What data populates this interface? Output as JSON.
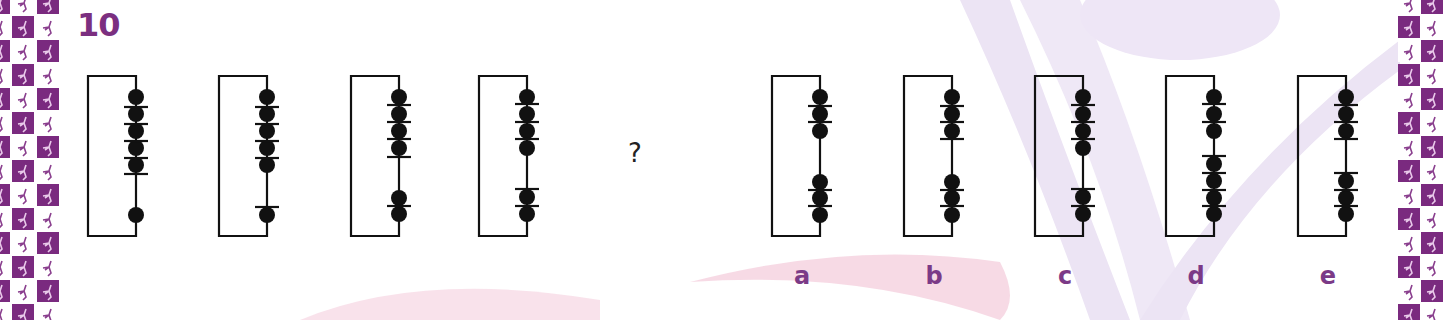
{
  "question": {
    "number": "10",
    "placeholder": "?"
  },
  "colors": {
    "accent_purple": "#7b2f80",
    "label_purple": "#7b3a87",
    "border_purple": "#7a2a7f",
    "bg_pink": "#f6d3e0",
    "bg_lavender": "#ece4f4",
    "ink": "#111111"
  },
  "sequence": [
    {
      "id": "fig-1",
      "x": 88,
      "beads": [
        97,
        114,
        131,
        148,
        165,
        215
      ],
      "ticks": [
        107,
        124,
        141,
        158,
        174
      ]
    },
    {
      "id": "fig-2",
      "x": 219,
      "beads": [
        97,
        114,
        131,
        148,
        165,
        215
      ],
      "ticks": [
        107,
        124,
        141,
        158,
        207
      ]
    },
    {
      "id": "fig-3",
      "x": 351,
      "beads": [
        97,
        114,
        131,
        148,
        198,
        214
      ],
      "ticks": [
        105,
        122,
        139,
        157,
        206
      ]
    },
    {
      "id": "fig-4",
      "x": 479,
      "beads": [
        97,
        114,
        131,
        148,
        197,
        214
      ],
      "ticks": [
        104,
        122,
        139,
        189,
        206
      ]
    }
  ],
  "options": [
    {
      "label": "a",
      "x": 772,
      "beads": [
        97,
        114,
        131,
        182,
        198,
        215
      ],
      "ticks": [
        106,
        122,
        190,
        206
      ]
    },
    {
      "label": "b",
      "x": 904,
      "beads": [
        97,
        114,
        131,
        182,
        198,
        215
      ],
      "ticks": [
        106,
        122,
        139,
        190,
        206
      ]
    },
    {
      "label": "c",
      "x": 1035,
      "beads": [
        97,
        114,
        131,
        148,
        197,
        214
      ],
      "ticks": [
        105,
        122,
        139,
        189,
        206
      ]
    },
    {
      "label": "d",
      "x": 1166,
      "beads": [
        97,
        114,
        131,
        164,
        181,
        198,
        214
      ],
      "ticks": [
        104,
        122,
        156,
        173,
        190,
        206
      ]
    },
    {
      "label": "e",
      "x": 1298,
      "beads": [
        97,
        114,
        131,
        181,
        198,
        214
      ],
      "ticks": [
        105,
        122,
        139,
        173,
        190,
        206
      ]
    }
  ]
}
